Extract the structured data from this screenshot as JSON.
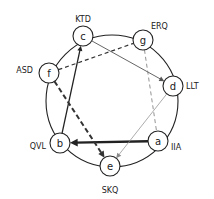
{
  "diagram": {
    "type": "directed-graph-on-ring",
    "ring": {
      "cx": 112,
      "cy": 101,
      "r": 66
    },
    "nodes": [
      {
        "id": "a",
        "letter": "a",
        "label": "IIA",
        "x": 158,
        "y": 141,
        "lx": 171,
        "ly": 147,
        "anchor": "start"
      },
      {
        "id": "b",
        "letter": "b",
        "label": "QVL",
        "x": 60,
        "y": 143,
        "lx": 46,
        "ly": 146,
        "anchor": "end"
      },
      {
        "id": "c",
        "letter": "c",
        "label": "KTD",
        "x": 83,
        "y": 36,
        "lx": 83,
        "ly": 19,
        "anchor": "middle"
      },
      {
        "id": "d",
        "letter": "d",
        "label": "LLT",
        "x": 173,
        "y": 86,
        "lx": 186,
        "ly": 86,
        "anchor": "start"
      },
      {
        "id": "e",
        "letter": "e",
        "label": "SKQ",
        "x": 110,
        "y": 166,
        "lx": 110,
        "ly": 190,
        "anchor": "middle"
      },
      {
        "id": "f",
        "letter": "f",
        "label": "ASD",
        "x": 49,
        "y": 73,
        "lx": 33,
        "ly": 70,
        "anchor": "end"
      },
      {
        "id": "g",
        "letter": "g",
        "label": "ERQ",
        "x": 143,
        "y": 40,
        "lx": 151,
        "ly": 26,
        "anchor": "start"
      }
    ],
    "edges": [
      {
        "from": "a",
        "to": "b",
        "style": "solid",
        "width": 2.4,
        "color": "#222222",
        "arrow": true
      },
      {
        "from": "b",
        "to": "c",
        "style": "solid",
        "width": 1.3,
        "color": "#222222",
        "arrow": true
      },
      {
        "from": "c",
        "to": "d",
        "style": "solid",
        "width": 0.9,
        "color": "#555555",
        "arrow": true
      },
      {
        "from": "d",
        "to": "e",
        "style": "solid",
        "width": 0.7,
        "color": "#888888",
        "arrow": true
      },
      {
        "from": "f",
        "to": "e",
        "style": "dashed",
        "width": 2.0,
        "color": "#333333",
        "arrow": true
      },
      {
        "from": "f",
        "to": "g",
        "style": "dashed",
        "width": 1.2,
        "color": "#333333",
        "arrow": false
      },
      {
        "from": "g",
        "to": "a",
        "style": "dashed",
        "width": 0.8,
        "color": "#777777",
        "arrow": false
      }
    ],
    "node_radius": 10
  }
}
